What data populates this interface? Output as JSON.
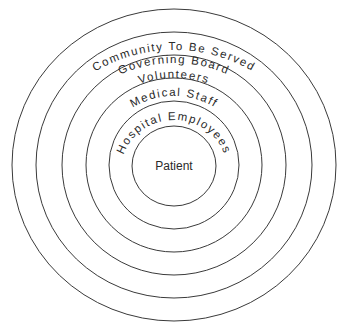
{
  "diagram": {
    "type": "concentric-circles",
    "center_label": "Patient",
    "rings": [
      {
        "label": "Hospital Employees",
        "order": 1
      },
      {
        "label": "Medical Staff",
        "order": 2
      },
      {
        "label": "Volunteers",
        "order": 3
      },
      {
        "label": "Governing Board",
        "order": 4
      },
      {
        "label": "Community To Be Served",
        "order": 5
      }
    ],
    "colors": {
      "stroke": "#3a3a3a",
      "text": "#2a2a2a",
      "background": "#ffffff"
    }
  }
}
